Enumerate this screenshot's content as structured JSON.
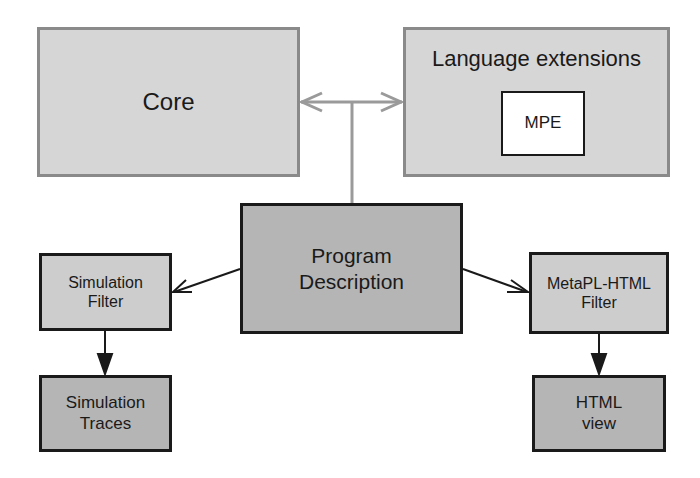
{
  "diagram": {
    "nodes": {
      "core": {
        "label": "Core"
      },
      "language_extensions": {
        "label": "Language extensions",
        "children": {
          "mpe": {
            "label": "MPE"
          }
        }
      },
      "program_description": {
        "label": "Program\nDescription"
      },
      "simulation_filter": {
        "label": "Simulation\nFilter"
      },
      "simulation_traces": {
        "label": "Simulation\nTraces"
      },
      "metapl_html_filter": {
        "label": "MetaPL-HTML\nFilter"
      },
      "html_view": {
        "label": "HTML\nview"
      }
    },
    "edges": [
      {
        "from": "program_description",
        "to": "core",
        "style": "open-arrow",
        "color": "#9a9a9a"
      },
      {
        "from": "program_description",
        "to": "language_extensions",
        "style": "open-arrow",
        "color": "#9a9a9a"
      },
      {
        "from": "program_description",
        "to": "simulation_filter",
        "style": "open-arrow",
        "color": "#1a1a1a"
      },
      {
        "from": "program_description",
        "to": "metapl_html_filter",
        "style": "open-arrow",
        "color": "#1a1a1a"
      },
      {
        "from": "simulation_filter",
        "to": "simulation_traces",
        "style": "filled-arrow",
        "color": "#1a1a1a"
      },
      {
        "from": "metapl_html_filter",
        "to": "html_view",
        "style": "filled-arrow",
        "color": "#1a1a1a"
      }
    ]
  }
}
